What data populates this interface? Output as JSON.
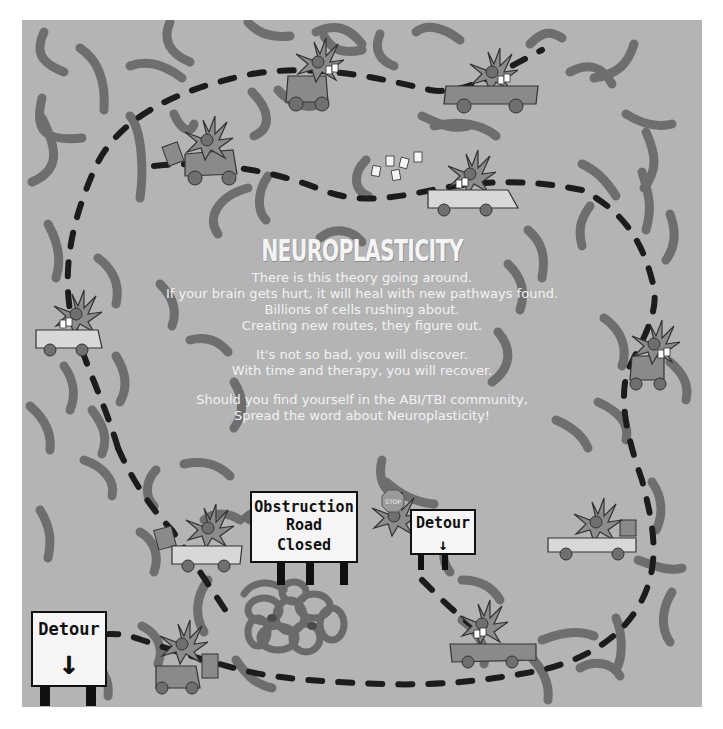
{
  "poster": {
    "title": "NEUROPLASTICITY",
    "stanzas": [
      {
        "lines": [
          "There is this theory going around.",
          "If your brain gets hurt, it will heal with new pathways found.",
          "Billions of cells rushing about.",
          "Creating new routes, they figure out."
        ]
      },
      {
        "lines": [
          "It's not so bad, you will discover.",
          "With time and therapy, you will recover."
        ]
      },
      {
        "lines": [
          "Should you find yourself in the ABI/TBI community,",
          "Spread the word about Neuroplasticity!"
        ]
      }
    ],
    "signs": {
      "obstruction": [
        "Obstruction",
        "Road",
        "Closed"
      ],
      "detour_right": {
        "label": "Detour",
        "arrow": "↓"
      },
      "detour_left": {
        "label": "Detour",
        "arrow": "↓"
      },
      "stop": "STOP"
    },
    "icons": [
      "neuron-driver-car-icon",
      "neuron-driver-cart-icon",
      "dashed-road-path",
      "brain-squiggle-pathways",
      "tangled-obstruction-knot",
      "stop-sign-icon"
    ],
    "colors": {
      "background": "#b4b4b4",
      "squiggle": "#6e6e6e",
      "road_dash": "#1c1c1c",
      "neuron": "#8c8c8c",
      "vehicle": "#8a8a8a",
      "vehicle_light": "#d8d8d8",
      "sign_face": "#f5f5f5",
      "text": "#f2f2f2"
    }
  }
}
